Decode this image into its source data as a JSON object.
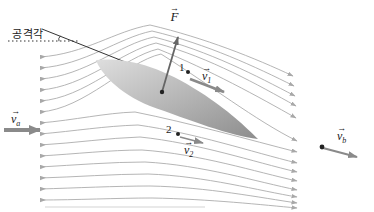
{
  "figure": {
    "labels": {
      "angle_of_attack": "공격각",
      "force": "F",
      "point1": "1",
      "point2": "2",
      "v": "v",
      "v1_sub": "1",
      "v2_sub": "2",
      "va_sub": "a",
      "vb_sub": "b",
      "vector_hat": "→"
    },
    "colors": {
      "background": "#ffffff",
      "streamline": "#a8a8a8",
      "vector_arrow": "#8a8a8a",
      "force_arrow": "#666666",
      "airfoil_light": "#dedede",
      "airfoil_dark": "#8d8d8d",
      "line": "#333333",
      "text": "#1a1a1a"
    }
  }
}
